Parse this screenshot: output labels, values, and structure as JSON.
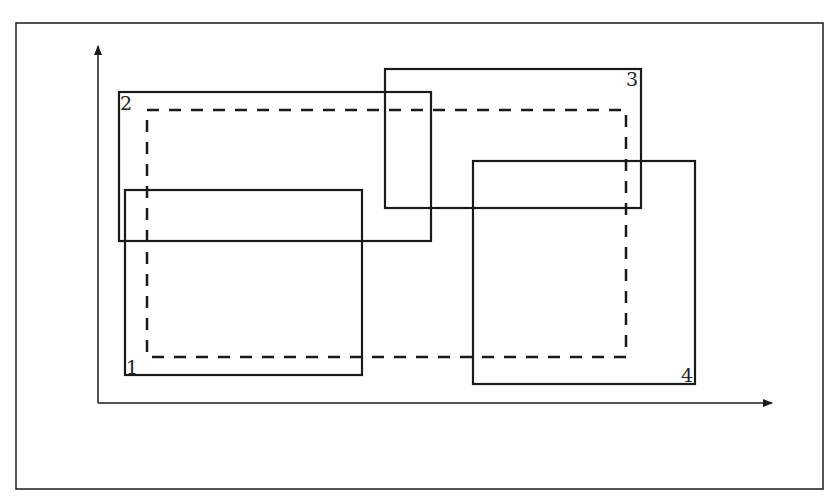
{
  "diagram": {
    "frame": {
      "x": 16,
      "y": 23,
      "w": 807,
      "h": 466
    },
    "axes": {
      "origin": [
        98,
        403
      ],
      "x_end": 772,
      "y_end": 46
    },
    "rectangles": [
      {
        "label": "1",
        "x": 125,
        "y": 190,
        "w": 237,
        "h": 185,
        "label_pos": [
          126,
          374
        ]
      },
      {
        "label": "2",
        "x": 119,
        "y": 92,
        "w": 312,
        "h": 149,
        "label_pos": [
          120,
          110
        ]
      },
      {
        "label": "3",
        "x": 385,
        "y": 69,
        "w": 256,
        "h": 139,
        "label_pos": [
          626,
          86
        ]
      },
      {
        "label": "4",
        "x": 473,
        "y": 161,
        "w": 222,
        "h": 223,
        "label_pos": [
          681,
          382
        ]
      }
    ],
    "dashed_rect": {
      "x": 147,
      "y": 110,
      "w": 479,
      "h": 247
    },
    "stroke_color": "#1a1a1a"
  }
}
